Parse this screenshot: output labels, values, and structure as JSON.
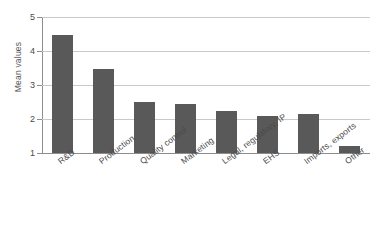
{
  "chart_data": {
    "type": "bar",
    "title": "",
    "xlabel": "",
    "ylabel": "Mean values",
    "ylim": [
      1,
      5
    ],
    "yticks": [
      1,
      2,
      3,
      4,
      5
    ],
    "ytick_labels": [
      "1",
      "2",
      "3",
      "4",
      "5"
    ],
    "grid": true,
    "legend": "none",
    "bar_color": "#595959",
    "categories": [
      "R&D",
      "Production",
      "Quality control",
      "Marketing",
      "Legal, regulatory, IP",
      "EHS",
      "Imports, exports",
      "Other"
    ],
    "values": [
      4.47,
      3.48,
      2.5,
      2.45,
      2.25,
      2.1,
      2.15,
      1.2
    ],
    "series": [
      {
        "name": "Mean values",
        "values": [
          4.47,
          3.48,
          2.5,
          2.45,
          2.25,
          2.1,
          2.15,
          1.2
        ]
      }
    ]
  }
}
